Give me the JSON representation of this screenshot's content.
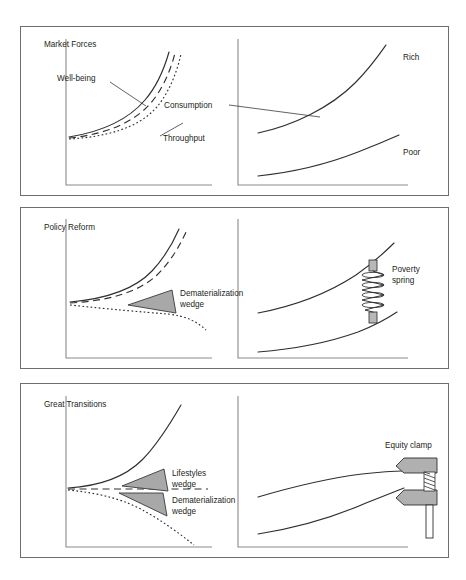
{
  "figure": {
    "type": "diagram",
    "title_visible": false,
    "background_color": "#ffffff",
    "line_color": "#2f2f33",
    "frame_color": "#6e6e72",
    "wedge_fill": "#a8a8a8",
    "clamp_fill": "#b0b0b0",
    "width": 466,
    "height": 580,
    "panel_count": 3,
    "charts_per_panel": 2
  },
  "panels": [
    {
      "id": "market-forces",
      "title": "Market Forces",
      "left_chart": {
        "curves": [
          {
            "name": "well-being",
            "style": "solid",
            "label": "Well-being",
            "behavior": "rises steeply"
          },
          {
            "name": "consumption",
            "style": "dashed",
            "label": "Consumption",
            "behavior": "rises steeply"
          },
          {
            "name": "throughput",
            "style": "dotted",
            "label": "Throughput",
            "behavior": "rises steeply"
          }
        ]
      },
      "right_chart": {
        "curves": [
          {
            "name": "rich",
            "style": "solid",
            "label": "Rich",
            "behavior": "rises steeply"
          },
          {
            "name": "poor",
            "style": "solid",
            "label": "Poor",
            "behavior": "rises slowly"
          }
        ]
      },
      "annotations": []
    },
    {
      "id": "policy-reform",
      "title": "Policy Reform",
      "left_chart": {
        "curves": [
          {
            "name": "well-being",
            "style": "solid",
            "label": "",
            "behavior": "rises steeply"
          },
          {
            "name": "consumption",
            "style": "dashed",
            "label": "",
            "behavior": "rises steeply"
          },
          {
            "name": "throughput",
            "style": "dotted",
            "label": "",
            "behavior": "flat then declines"
          }
        ]
      },
      "right_chart": {
        "curves": [
          {
            "name": "rich",
            "style": "solid",
            "label": "",
            "behavior": "rises"
          },
          {
            "name": "poor",
            "style": "solid",
            "label": "",
            "behavior": "rises"
          }
        ]
      },
      "annotations": [
        {
          "name": "dematerialization-wedge",
          "label_line1": "Dematerialization",
          "label_line2": "wedge",
          "shape": "wedge",
          "chart": "left"
        },
        {
          "name": "poverty-spring",
          "label_line1": "Poverty",
          "label_line2": "spring",
          "shape": "spring",
          "chart": "right"
        }
      ]
    },
    {
      "id": "great-transitions",
      "title": "Great Transitions",
      "left_chart": {
        "curves": [
          {
            "name": "well-being",
            "style": "solid",
            "label": "",
            "behavior": "rises very steeply"
          },
          {
            "name": "consumption",
            "style": "dashed",
            "label": "",
            "behavior": "flat"
          },
          {
            "name": "throughput",
            "style": "dotted",
            "label": "",
            "behavior": "declines steeply"
          }
        ]
      },
      "right_chart": {
        "curves": [
          {
            "name": "rich",
            "style": "solid",
            "label": "",
            "behavior": "rises then levels"
          },
          {
            "name": "poor",
            "style": "solid",
            "label": "",
            "behavior": "rises steeply to converge"
          }
        ]
      },
      "annotations": [
        {
          "name": "lifestyles-wedge",
          "label_line1": "Lifestyles",
          "label_line2": "wedge",
          "shape": "wedge",
          "chart": "left"
        },
        {
          "name": "dematerialization-wedge",
          "label_line1": "Dematerialization",
          "label_line2": "wedge",
          "shape": "wedge",
          "chart": "left"
        },
        {
          "name": "equity-clamp",
          "label_line1": "Equity clamp",
          "label_line2": "",
          "shape": "clamp",
          "chart": "right"
        }
      ]
    }
  ]
}
